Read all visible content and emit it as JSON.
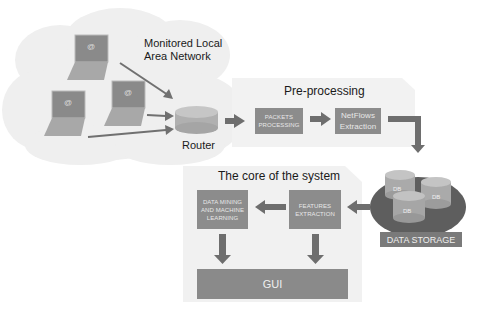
{
  "diagram": {
    "network": {
      "title_line1": "Monitored Local",
      "title_line2": "Area Network",
      "router_label": "Router",
      "laptop_icon_symbol": "@"
    },
    "preprocessing": {
      "title": "Pre-processing",
      "boxes": [
        {
          "line1": "PACKETS",
          "line2": "PROCESSING"
        },
        {
          "line1": "NetFlows",
          "line2": "Extraction"
        }
      ]
    },
    "core": {
      "title": "The core of the system",
      "boxes": [
        {
          "line1": "DATA MINING",
          "line2": "AND MACHINE",
          "line3": "LEARNING"
        },
        {
          "line1": "FEATURES",
          "line2": "EXTRACTION"
        }
      ],
      "gui_label": "GUI"
    },
    "storage": {
      "label": "DATA STORAGE",
      "db_labels": [
        "DB",
        "DB",
        "DB"
      ]
    },
    "colors": {
      "box": "#8c8c8c",
      "arrow": "#6e6e6e",
      "panel": "#f1f1f1",
      "cloud": "#eeeeee",
      "laptop": "#9a9a9a",
      "cylinder": "#b4b4b4"
    }
  }
}
